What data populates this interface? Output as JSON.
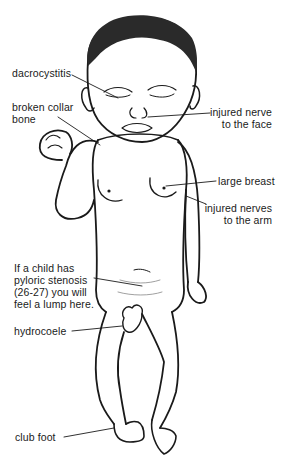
{
  "figure": {
    "labels": {
      "dacrocystitis": "dacrocystitis",
      "broken_collar_bone": [
        "broken collar",
        "bone"
      ],
      "injured_nerve_face": [
        "injured nerve",
        "to the face"
      ],
      "large_breast": "large breast",
      "injured_nerves_arm": [
        "injured nerves",
        "to the arm"
      ],
      "pyloric_stenosis": [
        "If a child has",
        "pyloric stenosis",
        "(26-27) you will",
        "feel a lump here."
      ],
      "hydrocoele": "hydrocoele",
      "club_foot": "club foot"
    }
  }
}
